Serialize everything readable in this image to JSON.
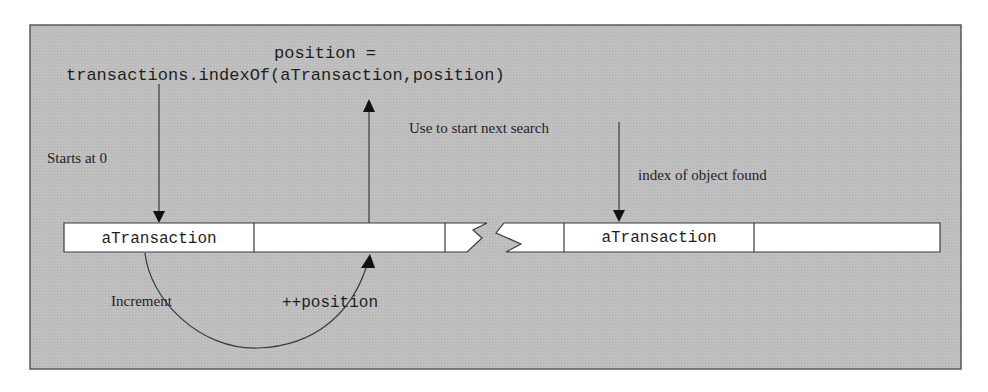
{
  "diagram": {
    "colors": {
      "panel_fill": "#bdbdbd",
      "panel_border": "#5a5a5a",
      "cell_fill": "#ffffff",
      "line": "#3a3a3a",
      "text": "#1e1e1e"
    },
    "code_label": {
      "line1": "position =",
      "line2": "transactions.indexOf(aTransaction,position)"
    },
    "annotations": {
      "starts_at_zero": "Starts at 0",
      "use_to_start_next_search": "Use to start next search",
      "index_of_object_found": "index of object found",
      "increment": "Increment",
      "increment_expr": "++position"
    },
    "array": {
      "cells": [
        {
          "label": "aTransaction"
        },
        {
          "label": ""
        },
        {
          "label": ""
        },
        {
          "label": ""
        },
        {
          "label": "aTransaction"
        },
        {
          "label": ""
        }
      ],
      "has_break": true
    },
    "arrows": [
      {
        "name": "start-arrow",
        "direction": "down",
        "from": "code",
        "to": "cell-0"
      },
      {
        "name": "result-arrow",
        "direction": "up",
        "from": "cell-1",
        "to": "code"
      },
      {
        "name": "found-arrow",
        "direction": "down",
        "from": "annotation",
        "to": "cell-4"
      },
      {
        "name": "increment-arc",
        "direction": "up",
        "from": "cell-0",
        "to": "cell-1"
      }
    ]
  }
}
